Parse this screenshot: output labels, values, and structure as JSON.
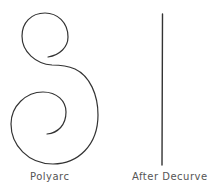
{
  "figure": {
    "panels": [
      {
        "caption": "Polyarc",
        "shape": "double-spiral-curve"
      },
      {
        "caption": "After Decurve",
        "shape": "vertical-straight-line"
      }
    ],
    "stroke_color": "#333333",
    "background_color": "#ffffff"
  }
}
